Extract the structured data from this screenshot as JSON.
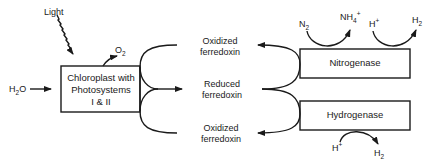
{
  "diagram": {
    "inputs": {
      "light": "Light",
      "water_main": "H",
      "water_sub": "2",
      "water_tail": "O",
      "oxygen_main": "O",
      "oxygen_sub": "2"
    },
    "chloroplast": {
      "line1": "Chloroplast with",
      "line2": "Photosystems",
      "line3": "I & II"
    },
    "ferredoxin": {
      "top_line1": "Oxidized",
      "top_line2": "ferredoxin",
      "mid_line1": "Reduced",
      "mid_line2": "ferredoxin",
      "bottom_line1": "Oxidized",
      "bottom_line2": "ferredoxin"
    },
    "nitrogenase": {
      "label": "Nitrogenase",
      "substrate_main": "N",
      "substrate_sub": "2",
      "product_main": "NH",
      "product_sub": "4",
      "product_sup": "+",
      "h_main": "H",
      "h_sup": "+",
      "h2_main": "H",
      "h2_sub": "2"
    },
    "hydrogenase": {
      "label": "Hydrogenase",
      "h_main": "H",
      "h_sup": "+",
      "h2_main": "H",
      "h2_sub": "2"
    },
    "colors": {
      "stroke": "#1a1a1a",
      "background": "#ffffff"
    }
  }
}
